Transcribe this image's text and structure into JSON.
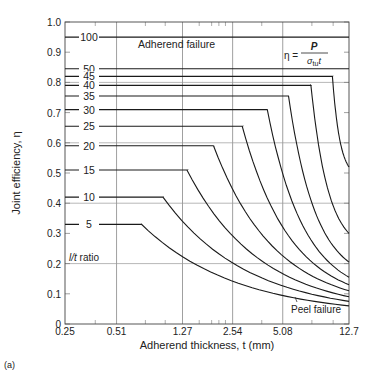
{
  "chart_data": {
    "type": "line",
    "panel_label": "(a)",
    "xlabel": "Adherend thickness, t (mm)",
    "ylabel": "Joint efficiency, η",
    "x_scale": "log",
    "xlim": [
      0.25,
      12.7
    ],
    "ylim": [
      0,
      1.0
    ],
    "x_ticks": [
      0.25,
      0.51,
      1.27,
      2.54,
      5.08,
      12.7
    ],
    "x_tick_labels": [
      "0.25",
      "0.51",
      "1.27",
      "2.54",
      "5.08",
      "12.7"
    ],
    "y_ticks": [
      0,
      0.1,
      0.2,
      0.3,
      0.4,
      0.5,
      0.6,
      0.7,
      0.8,
      0.9,
      1.0
    ],
    "y_tick_labels": [
      "0",
      "0.1",
      "0.2",
      "0.3",
      "0.4",
      "0.5",
      "0.6",
      "0.7",
      "0.8",
      "0.9",
      "1.0"
    ],
    "grid": true,
    "annotations": {
      "adherend_failure": "Adherend failure",
      "peel_failure": "Peel failure",
      "lt_ratio": "l/t ratio",
      "formula_lhs": "η =",
      "formula_num": "P",
      "formula_den": "σtu t"
    },
    "series": [
      {
        "name": "100",
        "plateau": 0.95,
        "knee_t": 12.7,
        "end_eta": 0.95
      },
      {
        "name": "50",
        "plateau": 0.845,
        "knee_t": 12.7,
        "end_eta": 0.845
      },
      {
        "name": "45",
        "plateau": 0.82,
        "knee_t": 10.1,
        "end_eta": 0.52
      },
      {
        "name": "40",
        "plateau": 0.79,
        "knee_t": 7.5,
        "end_eta": 0.3
      },
      {
        "name": "35",
        "plateau": 0.755,
        "knee_t": 5.5,
        "end_eta": 0.205
      },
      {
        "name": "30",
        "plateau": 0.71,
        "knee_t": 4.1,
        "end_eta": 0.155
      },
      {
        "name": "25",
        "plateau": 0.655,
        "knee_t": 2.9,
        "end_eta": 0.13
      },
      {
        "name": "20",
        "plateau": 0.59,
        "knee_t": 1.95,
        "end_eta": 0.11
      },
      {
        "name": "15",
        "plateau": 0.51,
        "knee_t": 1.35,
        "end_eta": 0.09
      },
      {
        "name": "10",
        "plateau": 0.42,
        "knee_t": 0.97,
        "end_eta": 0.075
      },
      {
        "name": "5",
        "plateau": 0.33,
        "knee_t": 0.72,
        "end_eta": 0.06
      }
    ]
  }
}
